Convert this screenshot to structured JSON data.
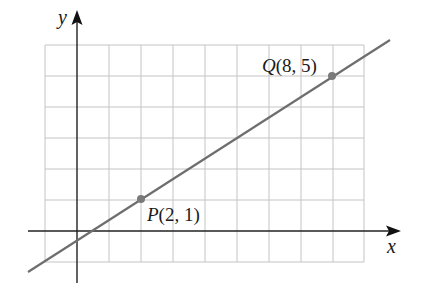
{
  "diagram": {
    "type": "coordinate-plane-line",
    "axes": {
      "x_label": "x",
      "y_label": "y"
    },
    "grid": {
      "x_min": -1,
      "x_max": 9,
      "y_min": -1,
      "y_max": 6,
      "spacing": 1
    },
    "points": [
      {
        "name": "P",
        "x": 2,
        "y": 1,
        "label_name": "P",
        "label_coords": "(2, 1)"
      },
      {
        "name": "Q",
        "x": 8,
        "y": 5,
        "label_name": "Q",
        "label_coords": "(8, 5)"
      }
    ],
    "line": {
      "through": [
        "P",
        "Q"
      ],
      "slope": "2/3",
      "color": "#6e6e6e"
    },
    "colors": {
      "grid": "#c4c4c4",
      "axis": "#222222",
      "point": "#7a7a7a"
    }
  }
}
